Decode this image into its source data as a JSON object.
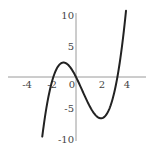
{
  "chart_data": {
    "type": "line",
    "title": "",
    "xlabel": "",
    "ylabel": "",
    "function": "f(x) = (2/3)x^3 - x^2 - 4x",
    "coefficients": {
      "a3": 0.6667,
      "a2": -1,
      "a1": -4,
      "a0": 0
    },
    "domain": [
      -2.7,
      4.0
    ],
    "xlim": [
      -5.3,
      5.5
    ],
    "ylim": [
      -12.2,
      12.4
    ],
    "x_ticks": [
      -4,
      -2,
      0,
      2,
      4
    ],
    "x_tick_labels": [
      "-4",
      "-2",
      "0",
      "2",
      "4"
    ],
    "y_ticks": [
      10,
      5,
      -5,
      -10
    ],
    "y_tick_labels": [
      "10",
      "5",
      "-5",
      "-10"
    ],
    "grid": false,
    "legend": null,
    "key_points": [
      {
        "label": "local max",
        "x": -1,
        "y": 2.33
      },
      {
        "label": "local min",
        "x": 2,
        "y": -6.67
      },
      {
        "label": "root",
        "x": -1.81,
        "y": 0
      },
      {
        "label": "root",
        "x": 0,
        "y": 0
      },
      {
        "label": "root",
        "x": 3.31,
        "y": 0
      }
    ],
    "series": [
      {
        "name": "f(x)",
        "x": [
          -2.7,
          -2.5,
          -2,
          -1.5,
          -1,
          -0.5,
          0,
          0.5,
          1,
          1.5,
          2,
          2.5,
          3,
          3.5,
          4
        ],
        "y": [
          -10.3,
          -6.67,
          -1.33,
          1.5,
          2.33,
          1.67,
          0,
          -2.17,
          -4.33,
          -5.99,
          -6.67,
          -5.83,
          -3,
          2.33,
          10.67
        ]
      }
    ],
    "colors": {
      "curve": "#222222",
      "axis": "#9a9a9a",
      "text": "#444444"
    }
  },
  "layout": {
    "origin_px": [
      76,
      77
    ],
    "x_px_per_unit": 12.5,
    "y_px_per_unit": 6.2,
    "axis_x_px": [
      8,
      146
    ],
    "axis_y_px": [
      13,
      141
    ]
  }
}
